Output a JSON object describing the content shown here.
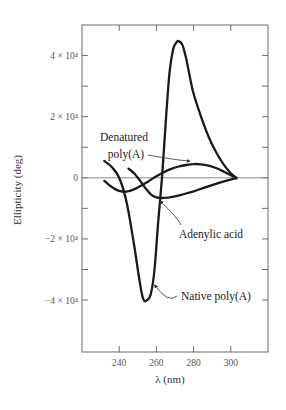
{
  "chart_data": {
    "type": "line",
    "title": "",
    "xlabel": "λ (nm)",
    "ylabel": "Ellipticity (deg)",
    "xlim": [
      220,
      320
    ],
    "ylim": [
      -57000,
      50000
    ],
    "grid": false,
    "legend": "none (curves labeled by annotations with arrows)",
    "x_ticks": [
      {
        "value": 240,
        "label": "240"
      },
      {
        "value": 260,
        "label": "260"
      },
      {
        "value": 280,
        "label": "280"
      },
      {
        "value": 300,
        "label": "300"
      }
    ],
    "y_ticks": [
      {
        "value": 40000,
        "label": "4 × 10⁴"
      },
      {
        "value": 20000,
        "label": "2 × 10⁴"
      },
      {
        "value": 0,
        "label": "0"
      },
      {
        "value": -20000,
        "label": "−2 × 10⁴"
      },
      {
        "value": -40000,
        "label": "−4 × 10⁴"
      }
    ],
    "y_minor_ticks": [
      30000,
      10000,
      -10000,
      -30000
    ],
    "series": [
      {
        "name": "Native poly(A)",
        "x": [
          232,
          236,
          240,
          244,
          248,
          251,
          253,
          255,
          257,
          259,
          261,
          263,
          265,
          267,
          269,
          271,
          272,
          274,
          276,
          278,
          280,
          284,
          288,
          292,
          296,
          300,
          303
        ],
        "y": [
          5500,
          3500,
          0,
          -8000,
          -22000,
          -34000,
          -39800,
          -40000,
          -38000,
          -30000,
          -14000,
          0,
          18000,
          34000,
          42000,
          44500,
          44700,
          43500,
          39000,
          33000,
          27500,
          20000,
          13500,
          8500,
          4500,
          1500,
          0
        ]
      },
      {
        "name": "Denatured poly(A)",
        "x": [
          232,
          236,
          240,
          244,
          248,
          252,
          256,
          260,
          264,
          268,
          272,
          276,
          280,
          284,
          288,
          292,
          296,
          300,
          303
        ],
        "y": [
          -1000,
          -3000,
          -4300,
          -4500,
          -3800,
          -2500,
          -1000,
          500,
          1800,
          2900,
          3700,
          4200,
          4500,
          4400,
          4000,
          3200,
          2100,
          900,
          0
        ]
      },
      {
        "name": "Adenylic acid",
        "x": [
          245,
          248,
          251,
          254,
          257,
          260,
          263,
          266,
          270,
          275,
          280,
          285,
          290,
          295,
          300,
          303
        ],
        "y": [
          3000,
          1500,
          -800,
          -3300,
          -5400,
          -6400,
          -6600,
          -6500,
          -6100,
          -5300,
          -4400,
          -3400,
          -2400,
          -1400,
          -600,
          -200
        ]
      }
    ],
    "annotations": [
      {
        "text_lines": [
          "Denatured",
          "poly(A)"
        ],
        "points_to": "Denatured poly(A)",
        "arrow_target": [
          278,
          4500
        ]
      },
      {
        "text_lines": [
          "Adenylic acid"
        ],
        "points_to": "Adenylic acid",
        "arrow_target": [
          262,
          -6600
        ]
      },
      {
        "text_lines": [
          "Native poly(A)"
        ],
        "points_to": "Native poly(A)",
        "arrow_target": [
          259,
          -35000
        ]
      }
    ]
  }
}
